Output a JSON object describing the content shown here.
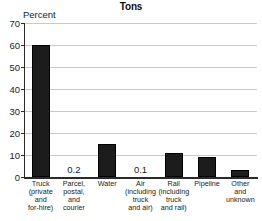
{
  "chart_data": {
    "type": "bar",
    "title": "Tons",
    "subtitle": "",
    "xlabel": "",
    "ylabel": "Percent",
    "ylim": [
      0,
      70
    ],
    "ytick_labels": [
      "70",
      "60",
      "50",
      "40",
      "30",
      "20",
      "10",
      "0"
    ],
    "yticks": [
      70,
      60,
      50,
      40,
      30,
      20,
      10,
      0
    ],
    "grid": true,
    "legend": false,
    "bar_color": "#1c1c1c",
    "categories": [
      "Truck (private and for-hire)",
      "Parcel, postal, and courier",
      "Water",
      "Air (including truck and air)",
      "Rail (including truck and rail)",
      "Pipeline",
      "Other and unknown"
    ],
    "category_lines": [
      [
        "Truck",
        "(private",
        "and",
        "for-hire)"
      ],
      [
        "Parcel,",
        "postal,",
        "and",
        "courier"
      ],
      [
        "Water"
      ],
      [
        "Air",
        "(including",
        "truck",
        "and air)"
      ],
      [
        "Rail",
        "(including",
        "truck",
        "and rail)"
      ],
      [
        "Pipeline"
      ],
      [
        "Other",
        "and",
        "unknown"
      ]
    ],
    "values": [
      60,
      0.2,
      15,
      0.1,
      11,
      9,
      3
    ],
    "data_labels": [
      "",
      "0.2",
      "",
      "0.1",
      "",
      "",
      ""
    ]
  }
}
